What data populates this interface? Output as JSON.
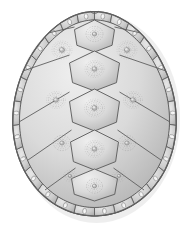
{
  "figure": {
    "style": "grayscale scientific illustration",
    "background_color": "#ffffff",
    "canvas": {
      "width": 189,
      "height": 226
    }
  },
  "palette": {
    "shell_base": "#c9c9c9",
    "shell_light": "#e4e4e4",
    "shell_mid": "#cfcfcf",
    "shell_dark": "#9d9d9d",
    "outline": "#5f5f5f",
    "outline_soft": "#808080",
    "ring_line": "#8a8a8a",
    "ring_center": "#b9b9b9",
    "highlight_dot": "#f2f2f2",
    "shadow": "#d9d9d9"
  },
  "shell": {
    "outline_name": "carapace-outline",
    "bounds": {
      "x": 13,
      "y": 10,
      "width": 163,
      "height": 206
    },
    "nuchal_notch": {
      "cx": 94.5,
      "cy": 12,
      "width": 9,
      "depth": 4
    }
  },
  "vertebral_scutes": {
    "label": "vertebral scutes",
    "count": 5,
    "items": [
      {
        "name": "vertebral-1",
        "cx": 94.5,
        "cy": 36,
        "rx": 20,
        "ry": 16,
        "ring_cx": 94.5,
        "ring_cy": 34,
        "ring_r": 8.5,
        "sides": 6
      },
      {
        "name": "vertebral-2",
        "cx": 94.5,
        "cy": 71,
        "rx": 25,
        "ry": 20,
        "ring_cx": 94.5,
        "ring_cy": 69,
        "ring_r": 9.5,
        "sides": 6
      },
      {
        "name": "vertebral-3",
        "cx": 94.5,
        "cy": 110,
        "rx": 25,
        "ry": 21,
        "ring_cx": 94.5,
        "ring_cy": 108,
        "ring_r": 10.0,
        "sides": 6
      },
      {
        "name": "vertebral-4",
        "cx": 94.5,
        "cy": 150,
        "rx": 24,
        "ry": 20,
        "ring_cx": 94.5,
        "ring_cy": 149,
        "ring_r": 9.5,
        "sides": 6
      },
      {
        "name": "vertebral-5",
        "cx": 94.5,
        "cy": 185,
        "rx": 23,
        "ry": 16,
        "ring_cx": 94.5,
        "ring_cy": 186,
        "ring_r": 8.0,
        "sides": 6
      }
    ]
  },
  "costal_scutes": {
    "label": "costal (pleural) scutes",
    "count": 8,
    "left": [
      {
        "name": "costal-left-1",
        "ring_cx": 62,
        "ring_cy": 50,
        "ring_r": 10.0
      },
      {
        "name": "costal-left-2",
        "ring_cx": 56,
        "ring_cy": 100,
        "ring_r": 9.5
      },
      {
        "name": "costal-left-3",
        "ring_cx": 62,
        "ring_cy": 143,
        "ring_r": 8.5
      },
      {
        "name": "costal-left-4",
        "ring_cx": 70,
        "ring_cy": 176,
        "ring_r": 6.5
      }
    ],
    "right": [
      {
        "name": "costal-right-1",
        "ring_cx": 127,
        "ring_cy": 50,
        "ring_r": 10.0
      },
      {
        "name": "costal-right-2",
        "ring_cx": 133,
        "ring_cy": 100,
        "ring_r": 9.5
      },
      {
        "name": "costal-right-3",
        "ring_cx": 127,
        "ring_cy": 143,
        "ring_r": 8.5
      },
      {
        "name": "costal-right-4",
        "ring_cx": 119,
        "ring_cy": 176,
        "ring_r": 6.5
      }
    ]
  },
  "marginal_scutes": {
    "label": "marginal scutes with highlight dots",
    "count": 26,
    "dot_radius": 1.9,
    "band_outer_pad": 0,
    "band_inner_pad": 13
  },
  "notes": {
    "ring_style": "concentric dashed growth rings around a small pale center",
    "shading": "soft radial highlight toward upper-left of each scute"
  }
}
